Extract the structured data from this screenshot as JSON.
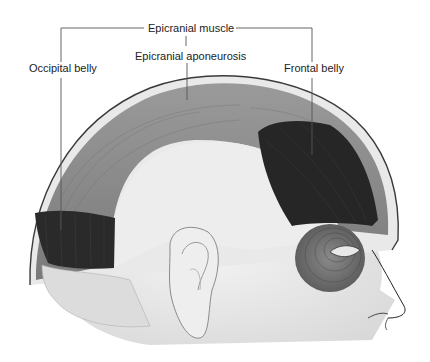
{
  "figure": {
    "colors": {
      "background": "#ffffff",
      "scalp_outline": "#3a3a3a",
      "aponeurosis": "#8a8a8a",
      "muscle_belly": "#2a2a2a",
      "orbicularis": "#6a6a6a",
      "skin": "#e6e6e6",
      "leader_line": "#555555"
    }
  },
  "labels": {
    "epicranial_muscle": "Epicranial muscle",
    "epicranial_aponeurosis": "Epicranial aponeurosis",
    "occipital_belly": "Occipital belly",
    "frontal_belly": "Frontal belly"
  }
}
